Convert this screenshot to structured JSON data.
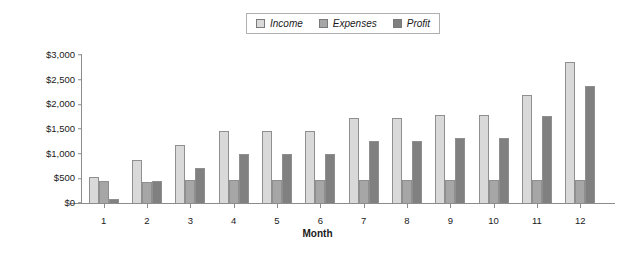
{
  "chart_data": {
    "type": "bar",
    "title": "",
    "xlabel": "Month",
    "ylabel": "",
    "categories": [
      "1",
      "2",
      "3",
      "4",
      "5",
      "6",
      "7",
      "8",
      "9",
      "10",
      "11",
      "12"
    ],
    "series": [
      {
        "name": "Income",
        "color": "#d9d9d9",
        "values": [
          530,
          880,
          1170,
          1450,
          1450,
          1450,
          1720,
          1720,
          1780,
          1780,
          2190,
          2850
        ]
      },
      {
        "name": "Expenses",
        "color": "#a6a6a6",
        "values": [
          450,
          430,
          460,
          470,
          470,
          470,
          470,
          470,
          470,
          470,
          470,
          470
        ]
      },
      {
        "name": "Profit",
        "color": "#808080",
        "values": [
          90,
          440,
          700,
          990,
          990,
          990,
          1260,
          1260,
          1310,
          1310,
          1760,
          2380
        ]
      }
    ],
    "ylim": [
      0,
      3000
    ],
    "ytick_values": [
      0,
      500,
      1000,
      1500,
      2000,
      2500,
      3000
    ],
    "ytick_labels": [
      "$0",
      "$500",
      "$1,000",
      "$1,500",
      "$2,000",
      "$2,500",
      "$3,000"
    ],
    "grid": false,
    "legend_position": "top-center"
  },
  "legend": {
    "items": [
      {
        "label": "Income",
        "color": "#d9d9d9"
      },
      {
        "label": "Expenses",
        "color": "#a6a6a6"
      },
      {
        "label": "Profit",
        "color": "#808080"
      }
    ]
  }
}
